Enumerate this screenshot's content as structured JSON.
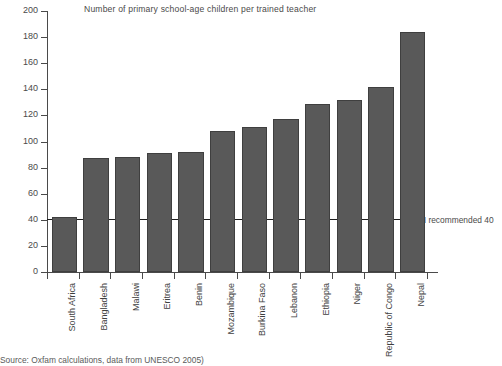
{
  "chart_data": {
    "type": "bar",
    "title": "Number of primary school-age children per trained teacher",
    "xlabel": "",
    "ylabel": "",
    "ylim": [
      0,
      200
    ],
    "ytick_step": 20,
    "yticks": [
      0,
      20,
      40,
      60,
      80,
      100,
      120,
      140,
      160,
      180,
      200
    ],
    "grid": false,
    "legend": "none",
    "bar_color": "#595959",
    "bar_edge_color": "#3f3f3f",
    "axis_color": "#4a4a4a",
    "categories": [
      "South Africa",
      "Bangladesh",
      "Malawi",
      "Eritrea",
      "Benin",
      "Mozambique",
      "Burkina Faso",
      "Lebanon",
      "Ethiopia",
      "Niger",
      "Republic of Congo",
      "Nepal"
    ],
    "values": [
      42,
      87,
      88,
      91,
      92,
      108,
      111,
      117,
      129,
      132,
      142,
      184
    ],
    "annotations": [
      {
        "type": "hline",
        "value": 40,
        "label": "UN recommended 40",
        "color": "#1d1d1d"
      }
    ]
  },
  "footer": {
    "source_note": "Source: Oxfam calculations, data from UNESCO 2005)"
  }
}
